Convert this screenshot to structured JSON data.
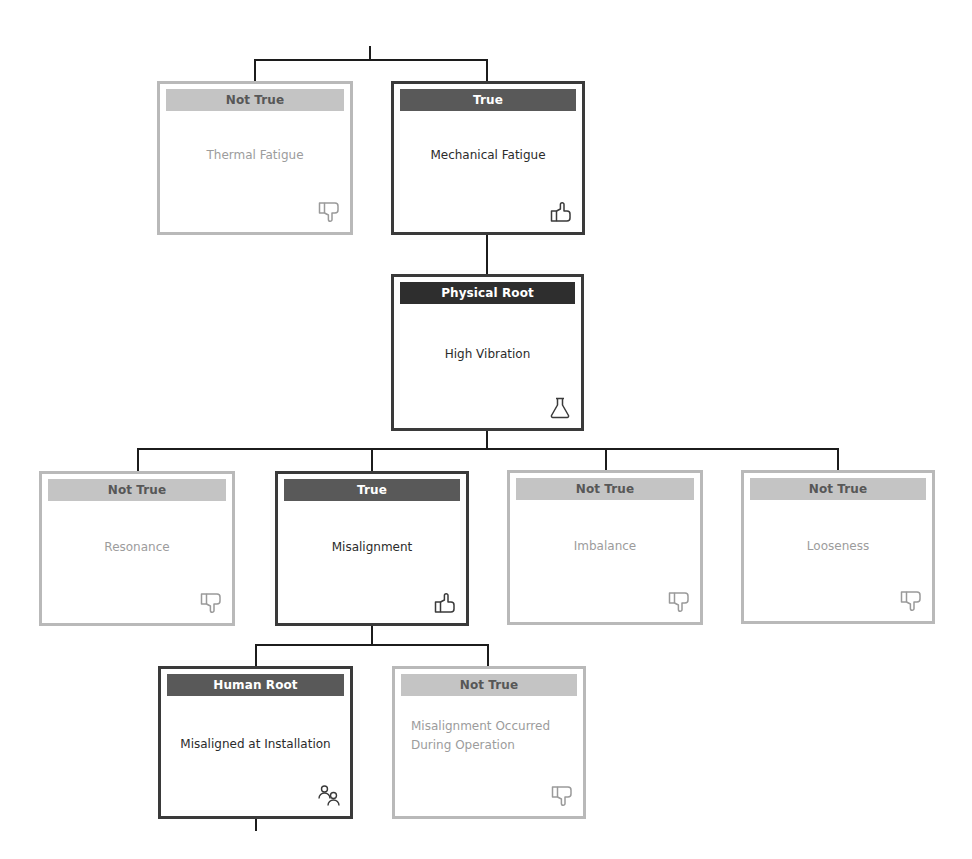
{
  "diagram": {
    "type": "root-cause-analysis-tree",
    "colors": {
      "connector": "#1c1c1c",
      "active_border": "#3a3a3a",
      "inactive_border": "#b9b9b9",
      "true_header": "#595959",
      "root_header": "#2e2e2e",
      "not_true_header": "#c4c4c4"
    },
    "nodes": [
      {
        "id": "thermal-fatigue",
        "status": "Not True",
        "label": "Thermal Fatigue",
        "icon": "thumbs-down-icon"
      },
      {
        "id": "mechanical-fatigue",
        "status": "True",
        "label": "Mechanical Fatigue",
        "icon": "thumbs-up-icon"
      },
      {
        "id": "high-vibration",
        "status": "Physical Root",
        "label": "High Vibration",
        "icon": "flask-icon"
      },
      {
        "id": "resonance",
        "status": "Not True",
        "label": "Resonance",
        "icon": "thumbs-down-icon"
      },
      {
        "id": "misalignment",
        "status": "True",
        "label": "Misalignment",
        "icon": "thumbs-up-icon"
      },
      {
        "id": "imbalance",
        "status": "Not True",
        "label": "Imbalance",
        "icon": "thumbs-down-icon"
      },
      {
        "id": "looseness",
        "status": "Not True",
        "label": "Looseness",
        "icon": "thumbs-down-icon"
      },
      {
        "id": "misaligned-at-installation",
        "status": "Human Root",
        "label": "Misaligned at Installation",
        "icon": "people-icon"
      },
      {
        "id": "misalignment-during-operation",
        "status": "Not True",
        "label": "Misalignment Occurred During Operation",
        "icon": "thumbs-down-icon"
      }
    ],
    "edges": [
      [
        "thermal-fatigue",
        "mechanical-fatigue"
      ],
      [
        "mechanical-fatigue",
        "high-vibration"
      ],
      [
        "high-vibration",
        "resonance"
      ],
      [
        "high-vibration",
        "misalignment"
      ],
      [
        "high-vibration",
        "imbalance"
      ],
      [
        "high-vibration",
        "looseness"
      ],
      [
        "misalignment",
        "misaligned-at-installation"
      ],
      [
        "misalignment",
        "misalignment-during-operation"
      ]
    ]
  }
}
